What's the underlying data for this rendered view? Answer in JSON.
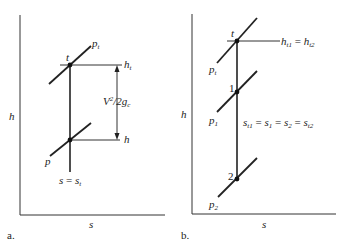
{
  "top_text_fragment": "...",
  "diagram_a": {
    "panel_label": "a.",
    "y_axis_label": "h",
    "x_axis_label": "s",
    "points": {
      "top": "t"
    },
    "isobar_top": {
      "base": "p",
      "sub": "t"
    },
    "isobar_bottom": {
      "base": "p",
      "sub": ""
    },
    "enthalpy_top": {
      "base": "h",
      "sub": "t"
    },
    "enthalpy_bottom": {
      "base": "h",
      "sub": ""
    },
    "velocity_term": {
      "base": "V",
      "sup": "2",
      "rest": "/2g",
      "sub": "c"
    },
    "entropy_label": {
      "lhs": "s",
      "eq": " = ",
      "rhs": "s",
      "rhs_sub": "t"
    }
  },
  "diagram_b": {
    "panel_label": "b.",
    "y_axis_label": "h",
    "x_axis_label": "s",
    "points": {
      "top": "t",
      "state1": "1",
      "state2": "2"
    },
    "isobar_top": {
      "base": "p",
      "sub": "t"
    },
    "isobar_1": {
      "base": "p",
      "sub": "1"
    },
    "isobar_2": {
      "base": "p",
      "sub": "2"
    },
    "enthalpy_label": {
      "a": "h",
      "a_sub": "t1",
      "eq": " = ",
      "b": "h",
      "b_sub": "t2"
    },
    "entropy_label": {
      "s1": "s",
      "s1_sub": "t1",
      "s2": "s",
      "s2_sub": "1",
      "s3": "s",
      "s3_sub": "2",
      "s4": "s",
      "s4_sub": "t2",
      "eq": " = "
    }
  }
}
